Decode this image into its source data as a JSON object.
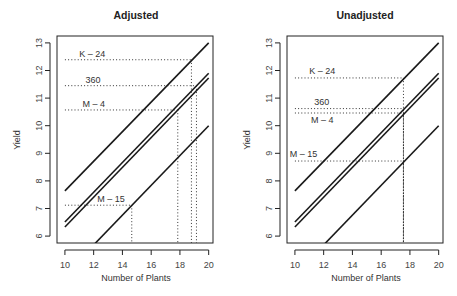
{
  "chart_data": [
    {
      "type": "line",
      "title": "Adjusted",
      "xlabel": "Number of Plants",
      "ylabel": "Yield",
      "xlim": [
        9.45,
        20.3
      ],
      "ylim": [
        5.75,
        13.25
      ],
      "xticks": [
        10,
        12,
        14,
        16,
        18,
        20
      ],
      "yticks": [
        6,
        7,
        8,
        9,
        10,
        11,
        12,
        13
      ],
      "grid": false,
      "series": [
        {
          "name": "K-24",
          "x": [
            10,
            20
          ],
          "y": [
            7.64,
            13.0
          ]
        },
        {
          "name": "360",
          "x": [
            10,
            20
          ],
          "y": [
            6.51,
            11.9
          ]
        },
        {
          "name": "M-4",
          "x": [
            10,
            20
          ],
          "y": [
            6.33,
            11.73
          ]
        },
        {
          "name": "M-15",
          "x": [
            10,
            20
          ],
          "y": [
            4.6,
            10.0
          ]
        }
      ],
      "guides": [
        {
          "name": "K-24",
          "x": 18.8,
          "y": 12.39
        },
        {
          "name": "360",
          "x": 19.15,
          "y": 11.45
        },
        {
          "name": "M-4",
          "x": 17.85,
          "y": 10.57
        },
        {
          "name": "M-15",
          "x": 14.65,
          "y": 7.12
        }
      ],
      "annotations": [
        {
          "text": "K – 24",
          "x": 11.9,
          "y": 12.6
        },
        {
          "text": "360",
          "x": 11.95,
          "y": 11.66
        },
        {
          "text": "M – 4",
          "x": 12.0,
          "y": 10.79
        },
        {
          "text": "M – 15",
          "x": 13.2,
          "y": 7.35
        }
      ]
    },
    {
      "type": "line",
      "title": "Unadjusted",
      "xlabel": "Number of Plants",
      "ylabel": "Yield",
      "xlim": [
        9.45,
        20.3
      ],
      "ylim": [
        5.75,
        13.25
      ],
      "xticks": [
        10,
        12,
        14,
        16,
        18,
        20
      ],
      "yticks": [
        6,
        7,
        8,
        9,
        10,
        11,
        12,
        13
      ],
      "grid": false,
      "series": [
        {
          "name": "K-24",
          "x": [
            10,
            20
          ],
          "y": [
            7.64,
            13.0
          ]
        },
        {
          "name": "360",
          "x": [
            10,
            20
          ],
          "y": [
            6.51,
            11.9
          ]
        },
        {
          "name": "M-4",
          "x": [
            10,
            20
          ],
          "y": [
            6.33,
            11.73
          ]
        },
        {
          "name": "M-15",
          "x": [
            10,
            20
          ],
          "y": [
            4.6,
            10.0
          ]
        }
      ],
      "guides": [
        {
          "name": "K-24",
          "x": 17.55,
          "y": 11.73
        },
        {
          "name": "360",
          "x": 17.55,
          "y": 10.62
        },
        {
          "name": "M-4",
          "x": 17.55,
          "y": 10.46
        },
        {
          "name": "M-15",
          "x": 17.55,
          "y": 8.72
        }
      ],
      "annotations": [
        {
          "text": "K – 24",
          "x": 11.9,
          "y": 12.0
        },
        {
          "text": "360",
          "x": 11.87,
          "y": 10.86
        },
        {
          "text": "M – 4",
          "x": 11.9,
          "y": 10.2
        },
        {
          "text": "M – 15",
          "x": 10.6,
          "y": 8.98
        }
      ]
    }
  ],
  "panels": [
    {
      "title": "Adjusted",
      "xlabel": "Number of Plants",
      "ylabel": "Yield"
    },
    {
      "title": "Unadjusted",
      "xlabel": "Number of Plants",
      "ylabel": "Yield"
    }
  ]
}
